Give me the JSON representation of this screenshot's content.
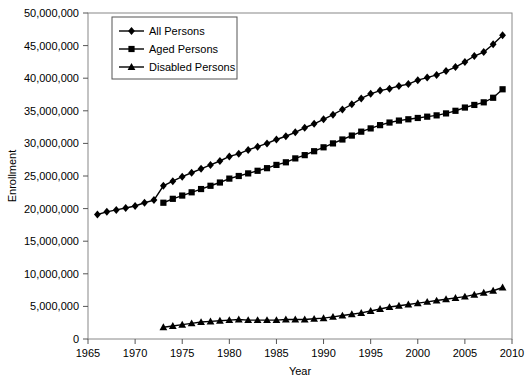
{
  "chart_data": {
    "type": "line",
    "title": "",
    "xlabel": "Year",
    "ylabel": "Enrollment",
    "xlim": [
      1965,
      2010
    ],
    "ylim": [
      0,
      50000000
    ],
    "xticks": [
      1965,
      1970,
      1975,
      1980,
      1985,
      1990,
      1995,
      2000,
      2005,
      2010
    ],
    "xtick_labels": [
      "1965",
      "1970",
      "1975",
      "1980",
      "1985",
      "1990",
      "1995",
      "2000",
      "2005",
      "2010"
    ],
    "yticks": [
      0,
      5000000,
      10000000,
      15000000,
      20000000,
      25000000,
      30000000,
      35000000,
      40000000,
      45000000,
      50000000
    ],
    "ytick_labels": [
      "0",
      "5,000,000",
      "10,000,000",
      "15,000,000",
      "20,000,000",
      "25,000,000",
      "30,000,000",
      "35,000,000",
      "40,000,000",
      "45,000,000",
      "50,000,000"
    ],
    "grid": false,
    "legend_position": "upper-left-inside",
    "series": [
      {
        "name": "All Persons",
        "marker": "diamond",
        "color": "#000000",
        "x": [
          1966,
          1967,
          1968,
          1969,
          1970,
          1971,
          1972,
          1973,
          1974,
          1975,
          1976,
          1977,
          1978,
          1979,
          1980,
          1981,
          1982,
          1983,
          1984,
          1985,
          1986,
          1987,
          1988,
          1989,
          1990,
          1991,
          1992,
          1993,
          1994,
          1995,
          1996,
          1997,
          1998,
          1999,
          2000,
          2001,
          2002,
          2003,
          2004,
          2005,
          2006,
          2007,
          2008,
          2009
        ],
        "values": [
          19100000,
          19500000,
          19800000,
          20100000,
          20400000,
          20900000,
          21300000,
          23500000,
          24200000,
          24900000,
          25500000,
          26100000,
          26700000,
          27300000,
          28000000,
          28400000,
          29000000,
          29500000,
          30000000,
          30600000,
          31100000,
          31700000,
          32400000,
          33000000,
          33700000,
          34400000,
          35200000,
          36000000,
          36900000,
          37600000,
          38100000,
          38400000,
          38800000,
          39100000,
          39700000,
          40100000,
          40500000,
          41100000,
          41700000,
          42500000,
          43400000,
          44000000,
          45200000,
          46600000
        ]
      },
      {
        "name": "Aged Persons",
        "marker": "square",
        "color": "#000000",
        "x": [
          1973,
          1974,
          1975,
          1976,
          1977,
          1978,
          1979,
          1980,
          1981,
          1982,
          1983,
          1984,
          1985,
          1986,
          1987,
          1988,
          1989,
          1990,
          1991,
          1992,
          1993,
          1994,
          1995,
          1996,
          1997,
          1998,
          1999,
          2000,
          2001,
          2002,
          2003,
          2004,
          2005,
          2006,
          2007,
          2008,
          2009
        ],
        "values": [
          20900000,
          21500000,
          22000000,
          22500000,
          23000000,
          23500000,
          24000000,
          24600000,
          25000000,
          25400000,
          25800000,
          26200000,
          26700000,
          27100000,
          27700000,
          28200000,
          28800000,
          29400000,
          30000000,
          30600000,
          31200000,
          31800000,
          32300000,
          32800000,
          33200000,
          33500000,
          33700000,
          33900000,
          34100000,
          34300000,
          34600000,
          35000000,
          35500000,
          35900000,
          36300000,
          37000000,
          38300000
        ]
      },
      {
        "name": "Disabled Persons",
        "marker": "triangle",
        "color": "#000000",
        "x": [
          1973,
          1974,
          1975,
          1976,
          1977,
          1978,
          1979,
          1980,
          1981,
          1982,
          1983,
          1984,
          1985,
          1986,
          1987,
          1988,
          1989,
          1990,
          1991,
          1992,
          1993,
          1994,
          1995,
          1996,
          1997,
          1998,
          1999,
          2000,
          2001,
          2002,
          2003,
          2004,
          2005,
          2006,
          2007,
          2008,
          2009
        ],
        "values": [
          1800000,
          2000000,
          2200000,
          2400000,
          2600000,
          2700000,
          2800000,
          2900000,
          3000000,
          2900000,
          2900000,
          2900000,
          2900000,
          3000000,
          3000000,
          3000000,
          3100000,
          3200000,
          3400000,
          3600000,
          3800000,
          4000000,
          4300000,
          4600000,
          4900000,
          5100000,
          5300000,
          5500000,
          5700000,
          5900000,
          6100000,
          6300000,
          6500000,
          6800000,
          7100000,
          7400000,
          7900000
        ]
      }
    ]
  },
  "legend": {
    "items": [
      {
        "label": "All Persons",
        "marker": "diamond"
      },
      {
        "label": "Aged Persons",
        "marker": "square"
      },
      {
        "label": "Disabled Persons",
        "marker": "triangle"
      }
    ]
  }
}
